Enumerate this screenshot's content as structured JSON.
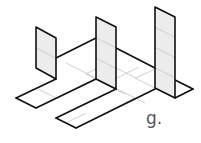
{
  "figure": {
    "label": "g.",
    "colors": {
      "outline": "#111111",
      "grid": "#c8c8c8",
      "panel_fill": "#ececec",
      "floor_fill": "#ffffff",
      "label": "#555555"
    },
    "panels": [
      {
        "name": "left-panel",
        "height_units": 2
      },
      {
        "name": "middle-panel",
        "height_units": 3
      },
      {
        "name": "right-panel",
        "height_units": 4
      }
    ]
  }
}
